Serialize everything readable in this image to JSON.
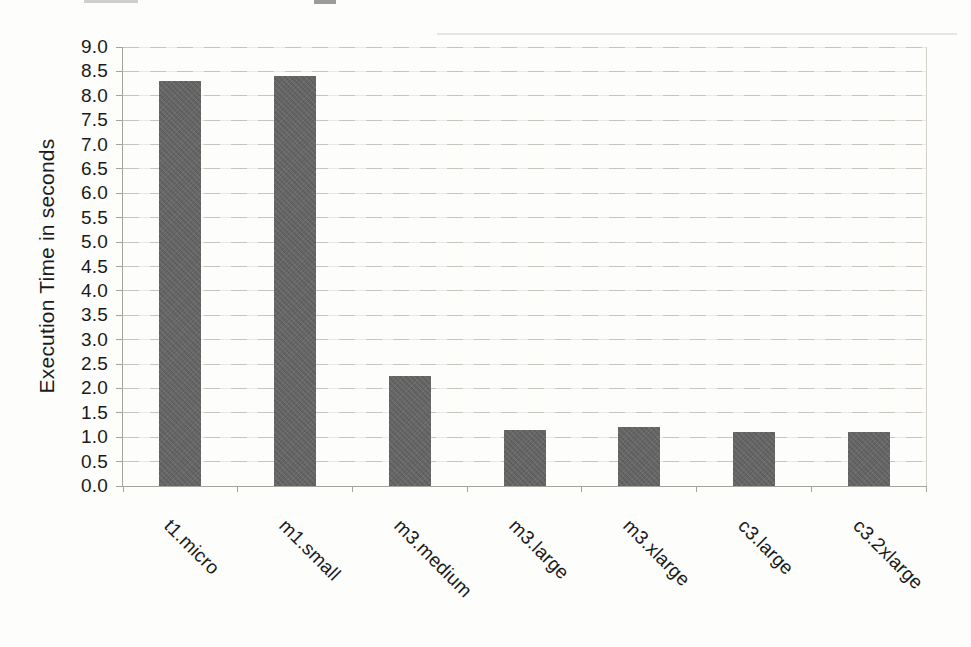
{
  "chart_data": {
    "type": "bar",
    "title": "",
    "xlabel": "",
    "ylabel": "Execution Time in seconds",
    "categories": [
      "t1.micro",
      "m1.small",
      "m3.medium",
      "m3.large",
      "m3.xlarge",
      "c3.large",
      "c3.2xlarge"
    ],
    "values": [
      8.3,
      8.4,
      2.25,
      1.15,
      1.2,
      1.1,
      1.1
    ],
    "ylim": [
      0.0,
      9.0
    ],
    "ytick_step": 0.5,
    "ytick_labels": [
      "0.0",
      "0.5",
      "1.0",
      "1.5",
      "2.0",
      "2.5",
      "3.0",
      "3.5",
      "4.0",
      "4.5",
      "5.0",
      "5.5",
      "6.0",
      "6.5",
      "7.0",
      "7.5",
      "8.0",
      "8.5",
      "9.0"
    ],
    "grid": "horizontal",
    "legend": "none",
    "colors": {
      "bar": "#696969",
      "gridline": "#beb9b3",
      "axis": "#a6a29c",
      "text": "#1a1a1a",
      "background": "#fdfdfc"
    }
  },
  "scan": {
    "artifact_note": "faint cropped text remnants along top edge of scanned page"
  }
}
